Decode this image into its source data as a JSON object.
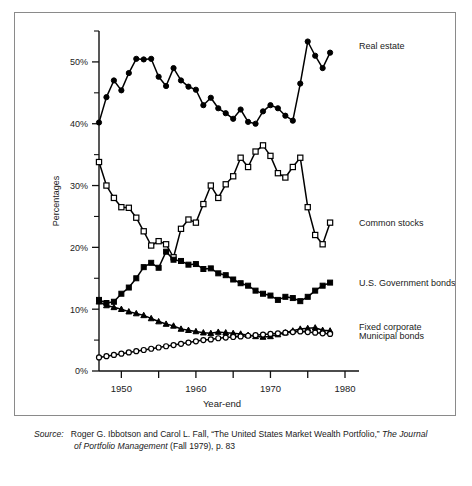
{
  "figure": {
    "y_axis_title": "Percentages",
    "x_axis_title": "Year-end",
    "y_tick_labels": [
      "0%",
      "10%",
      "20%",
      "30%",
      "40%",
      "50%"
    ],
    "x_tick_labels": [
      "1950",
      "1960",
      "1970",
      "1980"
    ],
    "legend": {
      "real_estate": "Real estate",
      "common_stocks": "Common stocks",
      "government_bonds": "U.S. Government bonds",
      "fixed_corporate": "Fixed corporate",
      "municipal_bonds": "Municipal bonds"
    }
  },
  "source": {
    "label": "Source:",
    "line1_a": "Roger G. Ibbotson and Carol L. Fall, “The United States Market Wealth Portfolio,” ",
    "line1_italic": "The Journal",
    "line2_italic": "of Portfolio Management",
    "line2_b": " (Fall 1979), p. 83"
  },
  "chart_data": {
    "type": "line",
    "title": "",
    "xlabel": "Year-end",
    "ylabel": "Percentages",
    "xlim": [
      1947,
      1980
    ],
    "ylim": [
      0,
      55
    ],
    "grid": false,
    "legend_position": "right-inline",
    "y_ticks_major": [
      0,
      10,
      20,
      30,
      40,
      50
    ],
    "y_ticks_minor": [
      5,
      15,
      25,
      35,
      45,
      55
    ],
    "x_ticks": [
      1950,
      1955,
      1960,
      1965,
      1970,
      1975,
      1980
    ],
    "x_tick_labeled": [
      1950,
      1960,
      1970,
      1980
    ],
    "x": [
      1947,
      1948,
      1949,
      1950,
      1951,
      1952,
      1953,
      1954,
      1955,
      1956,
      1957,
      1958,
      1959,
      1960,
      1961,
      1962,
      1963,
      1964,
      1965,
      1966,
      1967,
      1968,
      1969,
      1970,
      1971,
      1972,
      1973,
      1974,
      1975,
      1976,
      1977,
      1978
    ],
    "series": [
      {
        "name": "Real estate",
        "marker": "filled-circle",
        "values": [
          40.2,
          44.3,
          47.0,
          45.4,
          48.2,
          50.5,
          50.4,
          50.5,
          47.6,
          46.1,
          49.0,
          47.0,
          46.0,
          45.5,
          43.0,
          44.2,
          42.5,
          41.7,
          40.8,
          42.3,
          40.3,
          40.0,
          42.0,
          43.0,
          42.5,
          41.3,
          40.5,
          46.5,
          53.3,
          51.0,
          49.0,
          51.5
        ]
      },
      {
        "name": "Common stocks",
        "marker": "open-square",
        "values": [
          33.8,
          30.0,
          28.0,
          26.5,
          26.4,
          24.8,
          22.6,
          20.3,
          21.0,
          20.5,
          18.4,
          23.0,
          24.5,
          24.0,
          27.0,
          30.0,
          28.0,
          30.2,
          31.5,
          34.5,
          33.0,
          35.5,
          36.5,
          34.8,
          32.0,
          31.3,
          33.0,
          34.5,
          26.5,
          22.0,
          20.5,
          24.0
        ]
      },
      {
        "name": "U.S. Government bonds",
        "marker": "filled-square",
        "values": [
          11.5,
          11.0,
          11.2,
          12.5,
          13.5,
          15.0,
          16.8,
          17.5,
          16.7,
          19.3,
          18.0,
          17.8,
          17.2,
          17.3,
          16.5,
          16.6,
          15.8,
          15.5,
          14.8,
          14.2,
          13.8,
          13.0,
          12.5,
          12.2,
          11.5,
          12.0,
          11.8,
          11.3,
          12.0,
          13.0,
          13.8,
          14.3
        ]
      },
      {
        "name": "Fixed corporate",
        "marker": "filled-triangle",
        "values": [
          11.2,
          10.6,
          10.3,
          10.0,
          9.6,
          9.3,
          9.0,
          8.5,
          8.0,
          7.6,
          7.3,
          6.8,
          6.6,
          6.4,
          6.2,
          6.1,
          6.3,
          6.2,
          6.1,
          6.0,
          5.8,
          5.6,
          5.5,
          5.6,
          5.9,
          6.2,
          6.5,
          6.8,
          6.9,
          7.0,
          6.6,
          6.5
        ]
      },
      {
        "name": "Municipal bonds",
        "marker": "open-circle",
        "values": [
          2.2,
          2.4,
          2.6,
          2.8,
          3.0,
          3.2,
          3.4,
          3.6,
          3.8,
          4.0,
          4.2,
          4.4,
          4.6,
          4.8,
          5.0,
          5.1,
          5.3,
          5.4,
          5.5,
          5.6,
          5.7,
          5.8,
          5.9,
          6.0,
          6.1,
          6.2,
          6.3,
          6.4,
          6.3,
          6.2,
          6.1,
          6.0
        ]
      }
    ]
  }
}
